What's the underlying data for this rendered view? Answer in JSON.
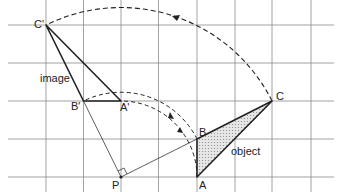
{
  "labels": {
    "c_prime": "C'",
    "b_prime": "B'",
    "a_prime": "A'",
    "p": "P",
    "a": "A",
    "b": "B",
    "c": "C",
    "image": "image",
    "object": "object"
  },
  "colors": {
    "grid": "#8a8a8a",
    "line": "#222222",
    "fill": "#cfcfcf"
  }
}
